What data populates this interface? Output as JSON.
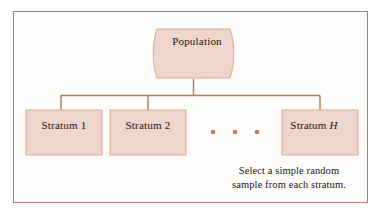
{
  "figure": {
    "kind": "stratified-sampling-tree-diagram",
    "background_color": "#ffffff",
    "frame_color": "#c4775c",
    "box_fill_color": "#efd5cb",
    "box_border_color": "#d89a7e",
    "connector_color": "#b5765a",
    "dot_color": "#c47a5c",
    "text_color": "#1c1410"
  },
  "root": {
    "label": "Population",
    "shape": "barrel"
  },
  "strata": [
    {
      "label": "Stratum 1",
      "italic_suffix": ""
    },
    {
      "label": "Stratum 2",
      "italic_suffix": ""
    },
    {
      "label": "Stratum",
      "italic_suffix": "H"
    }
  ],
  "ellipsis": {
    "glyph": "•",
    "count": 3
  },
  "caption": {
    "line_1": "Select a simple random",
    "line_2": "sample from each stratum."
  }
}
